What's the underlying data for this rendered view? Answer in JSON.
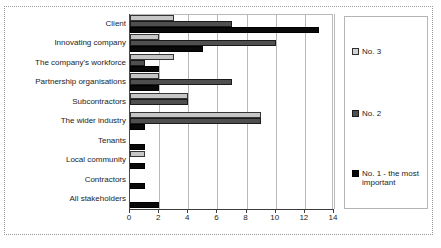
{
  "chart_data": {
    "type": "bar",
    "orientation": "horizontal",
    "title": "",
    "xlabel": "",
    "ylabel": "",
    "xlim": [
      0,
      14
    ],
    "xticks": [
      0,
      2,
      4,
      6,
      8,
      10,
      12,
      14
    ],
    "xtick_labels": [
      "0",
      "2",
      "4",
      "6",
      "8",
      "10",
      "12",
      "14"
    ],
    "grid": true,
    "grid_axis": "x",
    "legend_position": "right",
    "categories": [
      "Client",
      "Innovating company",
      "The company's workforce",
      "Partnership organisations",
      "Subcontractors",
      "The wider industry",
      "Tenants",
      "Local community",
      "Contractors",
      "All stakeholders"
    ],
    "series": [
      {
        "name": "No. 3",
        "color": "#c6c6c6",
        "values": [
          3,
          2,
          3,
          2,
          4,
          9,
          0,
          1,
          0,
          0
        ]
      },
      {
        "name": "No. 2",
        "color": "#4f4f4f",
        "values": [
          7,
          10,
          1,
          7,
          4,
          9,
          0,
          0,
          0,
          0
        ]
      },
      {
        "name": "No. 1 - the most important",
        "color": "#090909",
        "values": [
          13,
          5,
          2,
          2,
          0,
          1,
          1,
          1,
          1,
          2
        ]
      }
    ]
  },
  "legend": {
    "entries": [
      {
        "label": "No. 3"
      },
      {
        "label": "No. 2"
      },
      {
        "label": "No. 1 - the most important"
      }
    ]
  }
}
